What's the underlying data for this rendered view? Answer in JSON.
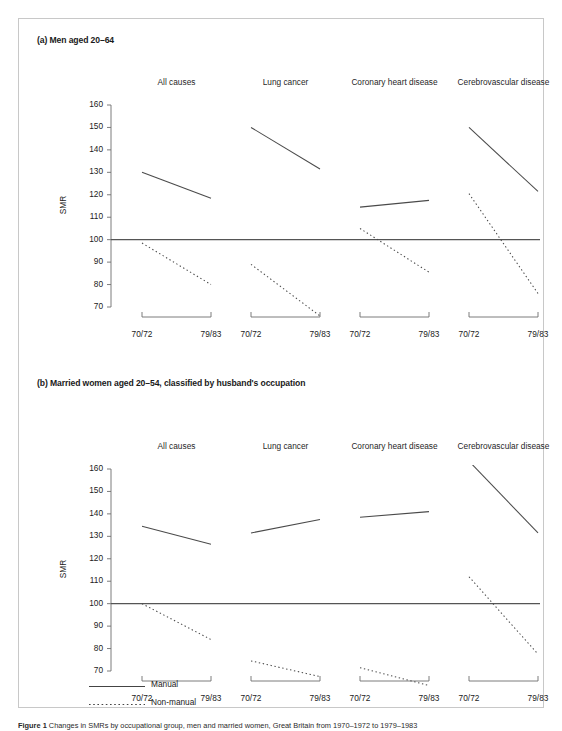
{
  "figure": {
    "caption_label": "Figure 1",
    "caption_text": " Changes in SMRs by occupational group, men and married women, Great Britain from 1970–1972 to 1979–1983"
  },
  "legend": {
    "position": "bottom-left",
    "items": [
      {
        "label": "Manual",
        "style": "solid",
        "color": "#444444"
      },
      {
        "label": "Non-manual",
        "style": "dashed",
        "color": "#444444"
      }
    ]
  },
  "panels": [
    {
      "id": "a",
      "title": "(a) Men aged 20–64",
      "ylabel": "SMR",
      "yticks": [
        70,
        80,
        90,
        100,
        110,
        120,
        130,
        140,
        150,
        160
      ],
      "ylim": [
        64,
        160
      ],
      "reference_line": 100,
      "xticks": [
        "70/72",
        "79/83"
      ],
      "facets": [
        {
          "title": "All causes",
          "series": [
            {
              "name": "Manual",
              "style": "solid",
              "values": [
                130.0,
                118.5
              ]
            },
            {
              "name": "Non-manual",
              "style": "dashed",
              "values": [
                98.5,
                80.0
              ]
            }
          ]
        },
        {
          "title": "Lung cancer",
          "series": [
            {
              "name": "Manual",
              "style": "solid",
              "values": [
                150.0,
                131.5
              ]
            },
            {
              "name": "Non-manual",
              "style": "dashed",
              "values": [
                89.0,
                66.0
              ]
            }
          ]
        },
        {
          "title": "Coronary heart disease",
          "series": [
            {
              "name": "Manual",
              "style": "solid",
              "values": [
                114.5,
                117.5
              ]
            },
            {
              "name": "Non-manual",
              "style": "dashed",
              "values": [
                105.0,
                85.5
              ]
            }
          ]
        },
        {
          "title": "Cerebrovascular disease",
          "series": [
            {
              "name": "Manual",
              "style": "solid",
              "values": [
                150.0,
                121.5
              ]
            },
            {
              "name": "Non-manual",
              "style": "dashed",
              "values": [
                120.5,
                76.0
              ]
            }
          ]
        }
      ]
    },
    {
      "id": "b",
      "title": "(b) Married women aged 20–54, classified by husband's occupation",
      "ylabel": "SMR",
      "yticks": [
        70,
        80,
        90,
        100,
        110,
        120,
        130,
        140,
        150,
        160
      ],
      "ylim": [
        62,
        160
      ],
      "reference_line": 100,
      "xticks": [
        "70/72",
        "79/83"
      ],
      "facets": [
        {
          "title": "All causes",
          "series": [
            {
              "name": "Manual",
              "style": "solid",
              "values": [
                134.5,
                126.5
              ]
            },
            {
              "name": "Non-manual",
              "style": "dashed",
              "values": [
                100.0,
                84.0
              ]
            }
          ]
        },
        {
          "title": "Lung cancer",
          "series": [
            {
              "name": "Manual",
              "style": "solid",
              "values": [
                131.5,
                137.5
              ]
            },
            {
              "name": "Non-manual",
              "style": "dashed",
              "values": [
                74.5,
                67.5
              ]
            }
          ]
        },
        {
          "title": "Coronary heart disease",
          "series": [
            {
              "name": "Manual",
              "style": "solid",
              "values": [
                138.5,
                141.0
              ]
            },
            {
              "name": "Non-manual",
              "style": "dashed",
              "values": [
                71.5,
                63.5
              ]
            }
          ]
        },
        {
          "title": "Cerebrovascular disease",
          "series": [
            {
              "name": "Manual",
              "style": "solid",
              "values": [
                163.5,
                131.5
              ]
            },
            {
              "name": "Non-manual",
              "style": "dashed",
              "values": [
                112.0,
                77.5
              ]
            }
          ]
        }
      ]
    }
  ],
  "chart_data": {
    "type": "line",
    "xlabel": "",
    "ylabel": "SMR",
    "x": [
      "70/72",
      "79/83"
    ],
    "ylim": [
      64,
      160
    ],
    "yticks": [
      70,
      80,
      90,
      100,
      110,
      120,
      130,
      140,
      150,
      160
    ],
    "grid": false,
    "legend_position": "bottom-left",
    "legend": [
      "Manual",
      "Non-manual"
    ],
    "reference_line": 100,
    "panels": [
      {
        "panel": "(a) Men aged 20–64",
        "facets": [
          {
            "facet": "All causes",
            "series": [
              {
                "name": "Manual",
                "values": [
                  130.0,
                  118.5
                ]
              },
              {
                "name": "Non-manual",
                "values": [
                  98.5,
                  80.0
                ]
              }
            ]
          },
          {
            "facet": "Lung cancer",
            "series": [
              {
                "name": "Manual",
                "values": [
                  150.0,
                  131.5
                ]
              },
              {
                "name": "Non-manual",
                "values": [
                  89.0,
                  66.0
                ]
              }
            ]
          },
          {
            "facet": "Coronary heart disease",
            "series": [
              {
                "name": "Manual",
                "values": [
                  114.5,
                  117.5
                ]
              },
              {
                "name": "Non-manual",
                "values": [
                  105.0,
                  85.5
                ]
              }
            ]
          },
          {
            "facet": "Cerebrovascular disease",
            "series": [
              {
                "name": "Manual",
                "values": [
                  150.0,
                  121.5
                ]
              },
              {
                "name": "Non-manual",
                "values": [
                  120.5,
                  76.0
                ]
              }
            ]
          }
        ]
      },
      {
        "panel": "(b) Married women aged 20–54, classified by husband's occupation",
        "facets": [
          {
            "facet": "All causes",
            "series": [
              {
                "name": "Manual",
                "values": [
                  134.5,
                  126.5
                ]
              },
              {
                "name": "Non-manual",
                "values": [
                  100.0,
                  84.0
                ]
              }
            ]
          },
          {
            "facet": "Lung cancer",
            "series": [
              {
                "name": "Manual",
                "values": [
                  131.5,
                  137.5
                ]
              },
              {
                "name": "Non-manual",
                "values": [
                  74.5,
                  67.5
                ]
              }
            ]
          },
          {
            "facet": "Coronary heart disease",
            "series": [
              {
                "name": "Manual",
                "values": [
                  138.5,
                  141.0
                ]
              },
              {
                "name": "Non-manual",
                "values": [
                  71.5,
                  63.5
                ]
              }
            ]
          },
          {
            "facet": "Cerebrovascular disease",
            "series": [
              {
                "name": "Manual",
                "values": [
                  163.5,
                  131.5
                ]
              },
              {
                "name": "Non-manual",
                "values": [
                  112.0,
                  77.5
                ]
              }
            ]
          }
        ]
      }
    ]
  }
}
